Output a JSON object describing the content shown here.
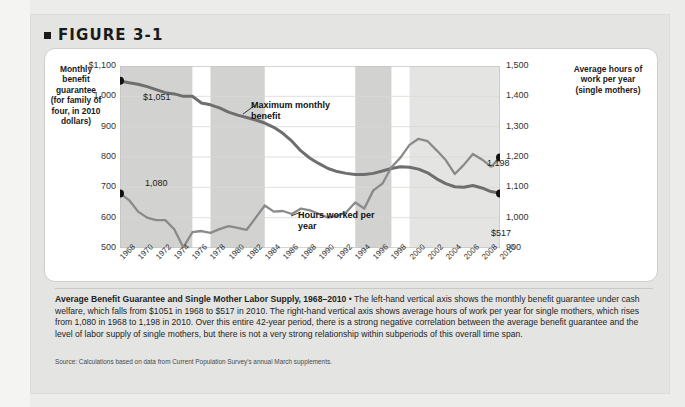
{
  "figure": {
    "number_label": "FIGURE 3-1",
    "bullet_icon": "square-bullet-icon"
  },
  "axes": {
    "left_title": "Monthly benefit guarantee (for family of four, in 2010 dollars)",
    "right_title": "Average hours of work per year (single mothers)",
    "left_ticks": [
      "$1,100",
      "1,000",
      "900",
      "800",
      "700",
      "600",
      "500"
    ],
    "right_ticks": [
      "1,500",
      "1,400",
      "1,300",
      "1,200",
      "1,100",
      "1,000",
      "900"
    ],
    "x_ticks": [
      "1968",
      "1970",
      "1972",
      "1974",
      "1976",
      "1978",
      "1980",
      "1982",
      "1984",
      "1986",
      "1988",
      "1990",
      "1992",
      "1994",
      "1996",
      "1998",
      "2000",
      "2002",
      "2004",
      "2006",
      "2008",
      "2010"
    ]
  },
  "annotations": {
    "benefit_series_label": "Maximum monthly benefit",
    "hours_series_label": "Hours worked per year",
    "benefit_start_label": "$1,051",
    "benefit_end_label": "$517",
    "hours_start_label": "1,080",
    "hours_end_label": "1,198"
  },
  "caption": {
    "title": "Average Benefit Guarantee and Single Mother Labor Supply, 1968–2010",
    "separator": " • ",
    "body": "The left-hand vertical axis shows the monthly benefit guarantee under cash welfare, which falls from $1051 in 1968 to $517 in 2010. The right-hand vertical axis shows average hours of work per year for single mothers, which rises from 1,080 in 1968 to 1,198 in 2010. Over this entire 42-year period, there is a strong negative correlation between the average benefit guarantee and the level of labor supply of single mothers, but there is not a very strong relationship within subperiods of this overall time span.",
    "source": "Source: Calculations based on data from Current Population Survey's annual March supplements."
  },
  "colors": {
    "benefit_line": "#6e6e6e",
    "hours_line": "#8a8a8a",
    "endpoint_dot": "#111111",
    "band_dark": "#d2d2d0",
    "band_light": "#e4e4e2",
    "grid": "#d8d8d6",
    "panel": "#ffffff",
    "page": "#e4e4e2"
  },
  "chart_data": {
    "type": "line",
    "title": "Average Benefit Guarantee and Single Mother Labor Supply, 1968–2010",
    "xlabel": "",
    "ylabel": "Monthly benefit guarantee (for family of four, in 2010 dollars)",
    "y2label": "Average hours of work per year (single mothers)",
    "xlim": [
      1968,
      2010
    ],
    "ylim": [
      500,
      1100
    ],
    "y2lim": [
      900,
      1500
    ],
    "grid": true,
    "legend": "inline-annotations",
    "x": [
      1968,
      1969,
      1970,
      1971,
      1972,
      1973,
      1974,
      1975,
      1976,
      1977,
      1978,
      1979,
      1980,
      1981,
      1982,
      1983,
      1984,
      1985,
      1986,
      1987,
      1988,
      1989,
      1990,
      1991,
      1992,
      1993,
      1994,
      1995,
      1996,
      1997,
      1998,
      1999,
      2000,
      2001,
      2002,
      2003,
      2004,
      2005,
      2006,
      2007,
      2008,
      2009,
      2010
    ],
    "series": [
      {
        "name": "Maximum monthly benefit",
        "axis": "left",
        "units": "2010 dollars per month",
        "values": [
          1051,
          1045,
          1040,
          1032,
          1022,
          1012,
          1008,
          1000,
          1000,
          978,
          972,
          962,
          948,
          938,
          930,
          922,
          912,
          898,
          878,
          852,
          820,
          796,
          778,
          762,
          752,
          746,
          742,
          742,
          746,
          754,
          762,
          768,
          766,
          760,
          748,
          728,
          712,
          702,
          700,
          706,
          698,
          686,
          680
        ]
      },
      {
        "name": "Hours worked per year",
        "axis": "right",
        "units": "hours per year",
        "values": [
          1080,
          1058,
          1020,
          1000,
          992,
          992,
          962,
          902,
          952,
          956,
          950,
          962,
          972,
          966,
          960,
          1000,
          1040,
          1020,
          1022,
          1012,
          1030,
          1024,
          1012,
          1000,
          1006,
          1018,
          1050,
          1030,
          1090,
          1112,
          1166,
          1198,
          1240,
          1260,
          1252,
          1222,
          1190,
          1144,
          1174,
          1210,
          1192,
          1168,
          1198
        ]
      }
    ],
    "shaded_bands": [
      {
        "from": 1968,
        "to": 1976,
        "shade": "dark"
      },
      {
        "from": 1978,
        "to": 1984,
        "shade": "dark"
      },
      {
        "from": 1994,
        "to": 1998,
        "shade": "dark"
      },
      {
        "from": 2000,
        "to": 2010,
        "shade": "light"
      }
    ],
    "point_labels": [
      {
        "series": "Maximum monthly benefit",
        "x": 1968,
        "text": "$1,051"
      },
      {
        "series": "Maximum monthly benefit",
        "x": 2010,
        "text": "$517"
      },
      {
        "series": "Hours worked per year",
        "x": 1968,
        "text": "1,080"
      },
      {
        "series": "Hours worked per year",
        "x": 2010,
        "text": "1,198"
      }
    ]
  }
}
